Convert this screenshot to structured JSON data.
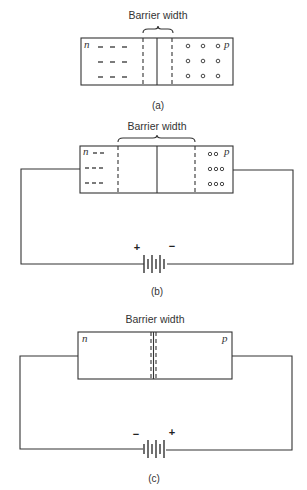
{
  "diagrams": [
    {
      "id": "a",
      "caption": "(a)",
      "barrier_label": "Barrier width",
      "n_label": "n",
      "p_label": "p",
      "bias": "none"
    },
    {
      "id": "b",
      "caption": "(b)",
      "barrier_label": "Barrier width",
      "n_label": "n",
      "p_label": "p",
      "bias": "reverse",
      "battery": {
        "left_sign": "+",
        "right_sign": "−"
      }
    },
    {
      "id": "c",
      "caption": "(c)",
      "barrier_label": "Barrier width",
      "n_label": "n",
      "p_label": "p",
      "bias": "forward",
      "battery": {
        "left_sign": "−",
        "right_sign": "+"
      }
    }
  ],
  "colors": {
    "line": "#333333",
    "background": "#ffffff"
  }
}
